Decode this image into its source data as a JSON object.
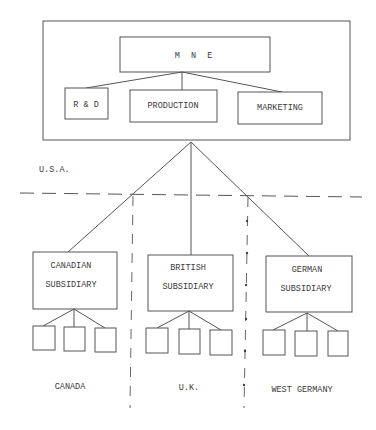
{
  "diagram": {
    "type": "organizational structure of a multinational enterprise",
    "parent": {
      "label": "M N E",
      "departments": [
        {
          "id": "rd",
          "label": "R & D"
        },
        {
          "id": "production",
          "label": "PRODUCTION"
        },
        {
          "id": "marketing",
          "label": "MARKETING"
        }
      ]
    },
    "home_country_label": "U.S.A.",
    "subsidiaries": [
      {
        "id": "canadian",
        "line1": "CANADIAN",
        "line2": "SUBSIDIARY",
        "country": "CANADA",
        "child_units": 3
      },
      {
        "id": "british",
        "line1": "BRITISH",
        "line2": "SUBSIDIARY",
        "country": "U.K.",
        "child_units": 3
      },
      {
        "id": "german",
        "line1": "GERMAN",
        "line2": "SUBSIDIARY",
        "country": "WEST GERMANY",
        "child_units": 3
      }
    ],
    "colors": {
      "line": "#555555",
      "text": "#3a3a3a",
      "background": "#ffffff"
    }
  }
}
